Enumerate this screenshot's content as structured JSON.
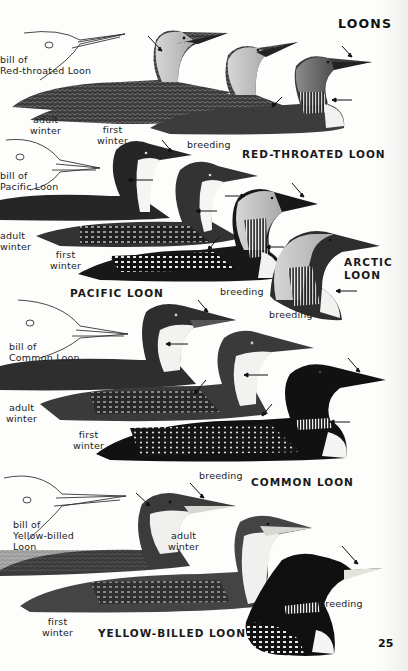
{
  "page": {
    "heading": "LOONS",
    "page_number": "25"
  },
  "sections": [
    {
      "species": "RED-THROATED LOON",
      "bill_label": [
        "bill of",
        "Red-throated Loon"
      ],
      "plumages": [
        {
          "label": [
            "adult",
            "winter"
          ]
        },
        {
          "label": [
            "first",
            "winter"
          ]
        },
        {
          "label": [
            "breeding"
          ]
        }
      ]
    },
    {
      "species": "PACIFIC LOON",
      "bill_label": [
        "bill of",
        "Pacific Loon"
      ],
      "plumages": [
        {
          "label": [
            "adult",
            "winter"
          ]
        },
        {
          "label": [
            "first",
            "winter"
          ]
        },
        {
          "label": [
            "breeding"
          ]
        }
      ]
    },
    {
      "species": "ARCTIC LOON",
      "species_lines": [
        "ARCTIC",
        "LOON"
      ],
      "plumages": [
        {
          "label": [
            "breeding"
          ]
        }
      ]
    },
    {
      "species": "COMMON LOON",
      "bill_label": [
        "bill of",
        "Common Loon"
      ],
      "plumages": [
        {
          "label": [
            "adult",
            "winter"
          ]
        },
        {
          "label": [
            "first",
            "winter"
          ]
        },
        {
          "label": [
            "breeding"
          ]
        }
      ]
    },
    {
      "species": "YELLOW-BILLED LOON",
      "bill_label": [
        "bill of",
        "Yellow-billed",
        "Loon"
      ],
      "plumages": [
        {
          "label": [
            "adult",
            "winter"
          ]
        },
        {
          "label": [
            "first",
            "winter"
          ]
        },
        {
          "label": [
            "breeding"
          ]
        }
      ]
    }
  ],
  "colors": {
    "paper": "#fdfdfc",
    "ink": "#1a1a1a",
    "dark_plumage": "#2a2a2a",
    "gray_plumage": "#6b6b6b",
    "pale_gray": "#b9b9b9",
    "white_throat": "#f4f4f2"
  }
}
